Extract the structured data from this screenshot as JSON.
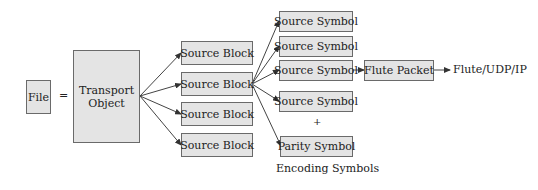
{
  "diagram": {
    "file": {
      "label": "File"
    },
    "equals": "=",
    "transport_object": {
      "line1": "Transport",
      "line2": "Object"
    },
    "source_blocks": [
      {
        "label": "Source Block"
      },
      {
        "label": "Source Block"
      },
      {
        "label": "Source Block"
      },
      {
        "label": "Source Block"
      }
    ],
    "source_symbols": [
      {
        "label": "Source Symbol"
      },
      {
        "label": "Source Symbol"
      },
      {
        "label": "Source Symbol"
      },
      {
        "label": "Source Symbol"
      }
    ],
    "plus": "+",
    "parity_symbol": {
      "label": "Parity Symbol"
    },
    "encoding_symbols_caption": "Encoding Symbols",
    "flute_packet": {
      "label": "Flute Packet"
    },
    "output_label": "Flute/UDP/IP"
  }
}
